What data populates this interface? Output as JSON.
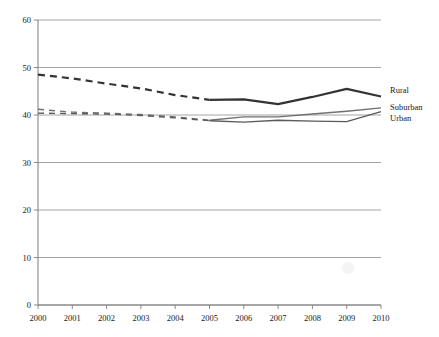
{
  "chart_data": {
    "type": "line",
    "title": "",
    "subtitle": "",
    "xlabel": "",
    "ylabel": "",
    "categories": [
      "2000",
      "2001",
      "2002",
      "2003",
      "2004",
      "2005",
      "2006",
      "2007",
      "2008",
      "2009",
      "2010"
    ],
    "x_tick_labels": [
      "2000",
      "2001",
      "2002",
      "2003",
      "2004",
      "2005",
      "2006",
      "2007",
      "2008",
      "2009",
      "2010"
    ],
    "y_tick_labels": [
      "0",
      "10",
      "20",
      "30",
      "40",
      "50",
      "60"
    ],
    "y_ticks": [
      0,
      10,
      20,
      30,
      40,
      50,
      60
    ],
    "ylim": [
      0,
      60
    ],
    "xlim": [
      2000,
      2010
    ],
    "grid": "horizontal",
    "legend_position": "right-inline",
    "series": [
      {
        "name": "Rural",
        "color": "#333333",
        "values": [
          48.5,
          47.7,
          46.6,
          45.6,
          44.2,
          43.2,
          43.3,
          42.3,
          43.8,
          45.5,
          43.9
        ],
        "dashed_range": [
          "2000",
          "2005"
        ],
        "solid_range": [
          "2005",
          "2010"
        ],
        "line_width": 2.2
      },
      {
        "name": "Suburban",
        "color": "#707070",
        "values": [
          41.2,
          40.6,
          40.4,
          40.1,
          39.6,
          38.9,
          39.6,
          39.6,
          40.2,
          40.8,
          41.5
        ],
        "dashed_range": [
          "2000",
          "2005"
        ],
        "solid_range": [
          "2005",
          "2010"
        ],
        "line_width": 1.4
      },
      {
        "name": "Urban",
        "color": "#5a5a5a",
        "values": [
          40.4,
          40.3,
          40.2,
          39.9,
          39.4,
          38.8,
          38.5,
          38.9,
          38.7,
          38.6,
          40.7
        ],
        "dashed_range": [
          "2000",
          "2005"
        ],
        "solid_range": [
          "2005",
          "2010"
        ],
        "line_width": 1.4
      }
    ],
    "legend": [
      {
        "label": "Rural",
        "color": "#333333"
      },
      {
        "label": "Suburban",
        "color": "#707070"
      },
      {
        "label": "Urban",
        "color": "#5a5a5a"
      }
    ],
    "annotations": []
  },
  "axis": {
    "y_title": "",
    "x_title": ""
  }
}
